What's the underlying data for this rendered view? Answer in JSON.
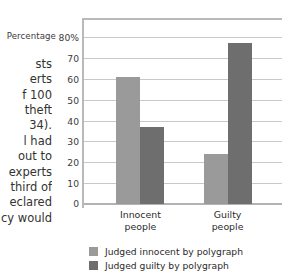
{
  "page": {
    "body_text_fragments": [
      "sts",
      "erts",
      "f 100",
      "theft",
      "34).",
      "l had",
      "out to",
      "experts",
      "third of",
      "eclared",
      "cy would"
    ]
  },
  "chart_data": {
    "type": "bar",
    "title": "",
    "xlabel": "",
    "ylabel": "Percentage",
    "categories": [
      "Innocent people",
      "Guilty people"
    ],
    "category_lines": [
      [
        "Innocent",
        "people"
      ],
      [
        "Guilty",
        "people"
      ]
    ],
    "series": [
      {
        "name": "Judged innocent by polygraph",
        "color": "#9a9a9a",
        "values": [
          61,
          24
        ]
      },
      {
        "name": "Judged guilty by polygraph",
        "color": "#6e6e6e",
        "values": [
          37,
          77
        ]
      }
    ],
    "ylim": [
      0,
      80
    ],
    "ytick_values": [
      80,
      70,
      60,
      50,
      40,
      30,
      20,
      10,
      0
    ],
    "ytick_labels": [
      "80%",
      "70",
      "60",
      "50",
      "40",
      "30",
      "20",
      "10",
      "0"
    ],
    "grid": true,
    "legend_position": "bottom-left"
  }
}
